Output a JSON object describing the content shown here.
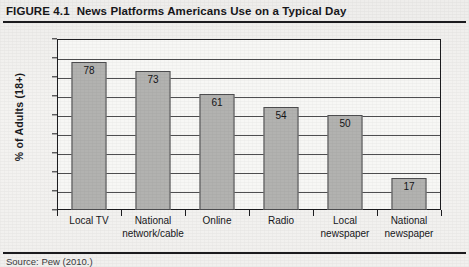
{
  "figure": {
    "label": "FIGURE 4.1",
    "title": "News Platforms Americans Use on a Typical Day",
    "source": "Source: Pew (2010.)"
  },
  "chart_data": {
    "type": "bar",
    "title": "News Platforms Americans Use on a Typical Day",
    "xlabel": "",
    "ylabel": "% of Adults (18+)",
    "ylim": [
      0,
      90
    ],
    "ytick_step": 10,
    "yticks": [
      0,
      10,
      20,
      30,
      40,
      50,
      60,
      70,
      80,
      90
    ],
    "grid": true,
    "legend": false,
    "bar_color": "#b2b2b0",
    "bar_edge_color": "#4e4e50",
    "categories": [
      "Local TV",
      "National network/cable",
      "Online",
      "Radio",
      "Local newspaper",
      "National newspaper"
    ],
    "category_lines": [
      [
        "Local TV"
      ],
      [
        "National",
        "network/cable"
      ],
      [
        "Online"
      ],
      [
        "Radio"
      ],
      [
        "Local",
        "newspaper"
      ],
      [
        "National",
        "newspaper"
      ]
    ],
    "values": [
      78,
      73,
      61,
      54,
      50,
      17
    ],
    "data_labels": [
      "78",
      "73",
      "61",
      "54",
      "50",
      "17"
    ]
  }
}
